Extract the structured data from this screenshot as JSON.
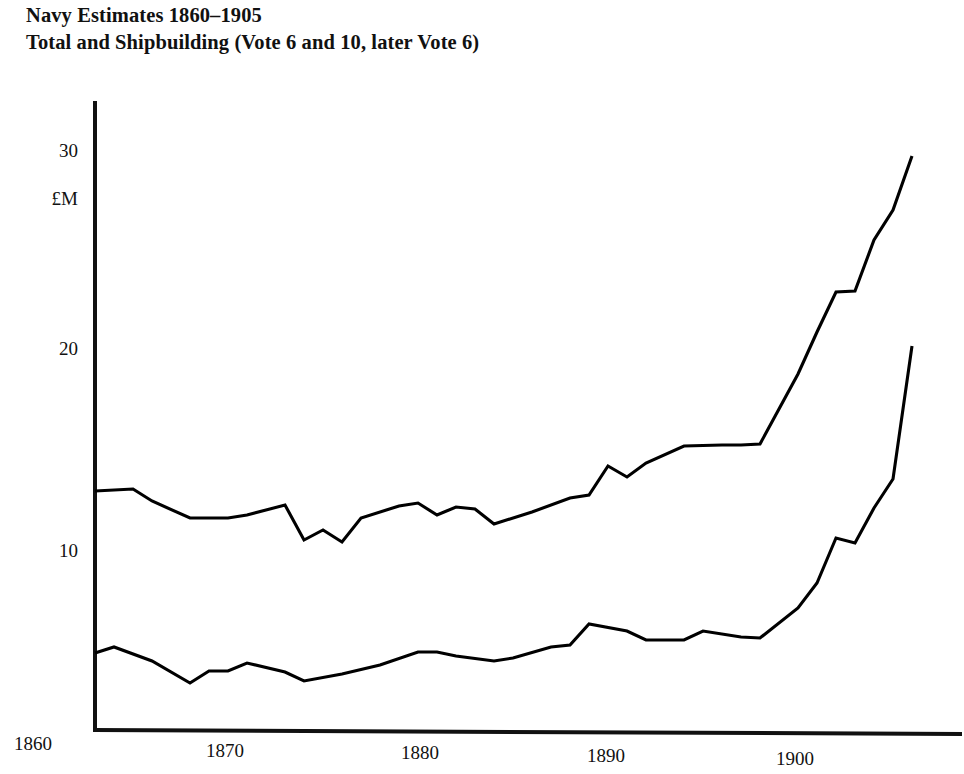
{
  "title": {
    "line1": "Navy Estimates 1860–1905",
    "line2": "Total and Shipbuilding (Vote 6 and 10, later Vote 6)"
  },
  "axes": {
    "y_unit": "£M",
    "y_ticks": [
      "10",
      "20",
      "30"
    ],
    "x_ticks": [
      "1860",
      "1870",
      "1880",
      "1890",
      "1900"
    ]
  },
  "chart_data": {
    "type": "line",
    "xlabel": "",
    "ylabel": "£M",
    "xlim": [
      1860,
      1905
    ],
    "ylim": [
      0,
      34
    ],
    "grid": false,
    "legend": "none",
    "x_tick_values": [
      1860,
      1870,
      1880,
      1890,
      1900
    ],
    "y_tick_values": [
      10,
      20,
      30
    ],
    "series": [
      {
        "name": "Total Navy Estimates",
        "color": "#000000",
        "x": [
          1862,
          1864,
          1865,
          1867,
          1869,
          1870,
          1872,
          1873,
          1874,
          1875,
          1876,
          1878,
          1879,
          1880,
          1881,
          1882,
          1883,
          1885,
          1887,
          1888,
          1889,
          1890,
          1891,
          1893,
          1895,
          1896,
          1897,
          1899,
          1900,
          1901,
          1902,
          1903,
          1904,
          1905
        ],
        "y": [
          13.05,
          13.15,
          12.55,
          11.7,
          11.7,
          11.85,
          12.35,
          10.6,
          11.1,
          10.5,
          11.7,
          12.3,
          12.45,
          11.85,
          12.25,
          12.15,
          11.4,
          12.0,
          12.7,
          12.85,
          14.3,
          13.75,
          14.45,
          15.3,
          15.35,
          15.35,
          15.4,
          18.9,
          21.0,
          23.0,
          23.05,
          25.6,
          27.1,
          29.8
        ]
      },
      {
        "name": "Shipbuilding Vote (Vote 6 and 10, later Vote 6)",
        "color": "#000000",
        "x": [
          1862,
          1863,
          1865,
          1867,
          1868,
          1869,
          1870,
          1872,
          1873,
          1875,
          1877,
          1879,
          1880,
          1881,
          1883,
          1884,
          1886,
          1887,
          1888,
          1890,
          1891,
          1893,
          1894,
          1896,
          1897,
          1899,
          1900,
          1901,
          1902,
          1903,
          1904,
          1905
        ],
        "y": [
          4.95,
          5.25,
          4.55,
          3.45,
          4.05,
          4.05,
          4.45,
          4.0,
          3.55,
          3.9,
          4.35,
          5.0,
          5.0,
          4.8,
          4.55,
          4.7,
          5.25,
          5.35,
          6.4,
          6.05,
          5.6,
          5.6,
          6.05,
          5.75,
          5.7,
          7.2,
          8.45,
          10.7,
          10.45,
          12.2,
          13.65,
          20.3
        ]
      }
    ]
  }
}
